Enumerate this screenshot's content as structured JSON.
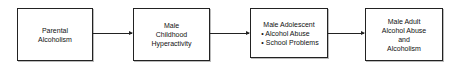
{
  "diagram": {
    "nodes": [
      {
        "id": "parental-alcoholism",
        "lines": [
          "Parental",
          "Alcoholism"
        ]
      },
      {
        "id": "male-childhood-hyperactivity",
        "lines": [
          "Male",
          "Childhood",
          "Hyperactivity"
        ]
      },
      {
        "id": "male-adolescent",
        "title": "Male Adolescent",
        "bullets": [
          "Alcohol Abuse",
          "School Problems"
        ]
      },
      {
        "id": "male-adult",
        "lines": [
          "Male Adult",
          "Alcohol Abuse",
          "and",
          "Alcoholism"
        ]
      }
    ],
    "edges": [
      {
        "from": "parental-alcoholism",
        "to": "male-childhood-hyperactivity"
      },
      {
        "from": "male-childhood-hyperactivity",
        "to": "male-adolescent"
      },
      {
        "from": "male-adolescent",
        "to": "male-adult"
      }
    ]
  }
}
